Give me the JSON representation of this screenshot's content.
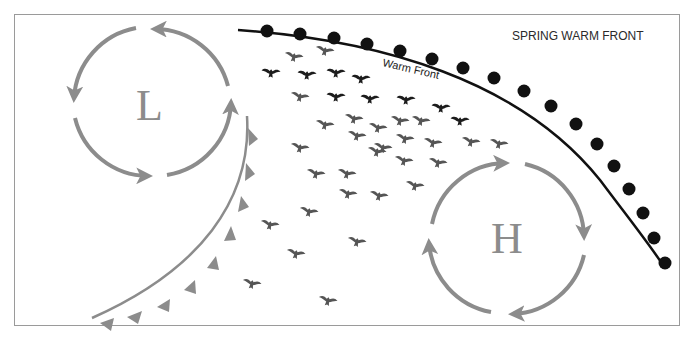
{
  "title": "SPRING WARM FRONT",
  "warm_front": {
    "label": "Warm Front",
    "color": "#111111"
  },
  "cold_front": {
    "color": "#8c8c8c"
  },
  "low_pressure": {
    "letter": "L",
    "center": [
      150,
      105
    ],
    "radius": 76,
    "rotation": "counterclockwise",
    "color": "#8c8c8c"
  },
  "high_pressure": {
    "letter": "H",
    "center": [
      510,
      238
    ],
    "radius": 76,
    "rotation": "clockwise",
    "color": "#8c8c8c"
  },
  "colors": {
    "frame": "#9a9a9a",
    "arrows": "#8c8c8c",
    "birds_dark": "#1c1c1c",
    "birds_mid": "#555555"
  },
  "birds": [
    [
      294,
      56,
      1
    ],
    [
      325,
      50,
      1
    ],
    [
      271,
      72,
      0
    ],
    [
      307,
      74,
      0
    ],
    [
      336,
      72,
      0
    ],
    [
      361,
      78,
      0
    ],
    [
      300,
      96,
      1
    ],
    [
      336,
      96,
      0
    ],
    [
      370,
      98,
      0
    ],
    [
      406,
      99,
      0
    ],
    [
      441,
      107,
      0
    ],
    [
      325,
      124,
      1
    ],
    [
      354,
      118,
      1
    ],
    [
      378,
      127,
      1
    ],
    [
      400,
      120,
      1
    ],
    [
      421,
      120,
      1
    ],
    [
      460,
      120,
      0
    ],
    [
      357,
      135,
      1
    ],
    [
      383,
      147,
      1
    ],
    [
      405,
      138,
      1
    ],
    [
      433,
      142,
      1
    ],
    [
      471,
      141,
      1
    ],
    [
      499,
      143,
      1
    ],
    [
      300,
      147,
      1
    ],
    [
      377,
      151,
      1
    ],
    [
      404,
      160,
      1
    ],
    [
      438,
      162,
      1
    ],
    [
      316,
      173,
      1
    ],
    [
      347,
      173,
      1
    ],
    [
      379,
      195,
      1
    ],
    [
      415,
      185,
      1
    ],
    [
      348,
      193,
      1
    ],
    [
      309,
      211,
      1
    ],
    [
      270,
      224,
      1
    ],
    [
      357,
      241,
      1
    ],
    [
      296,
      253,
      1
    ],
    [
      252,
      283,
      1
    ],
    [
      328,
      300,
      1
    ]
  ]
}
